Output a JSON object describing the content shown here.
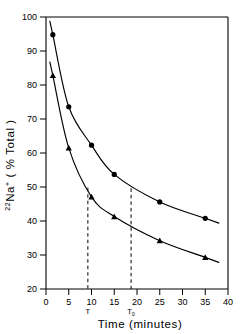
{
  "chart_data": {
    "type": "scatter",
    "title": "",
    "xlabel": "Time (minutes)",
    "ylabel": "22Na+ (% Total)",
    "ylabel_parts": {
      "superscript": "22",
      "element": "Na",
      "charge": "+",
      "units": "( % Total )"
    },
    "xlim": [
      0,
      40
    ],
    "ylim": [
      20,
      100
    ],
    "xticks": [
      0,
      5,
      10,
      15,
      20,
      25,
      30,
      35,
      40
    ],
    "xtick_labels": [
      "0",
      "5",
      "10",
      "15",
      "20",
      "25",
      "30",
      "35",
      "40"
    ],
    "yticks": [
      20,
      30,
      40,
      50,
      60,
      70,
      80,
      90,
      100
    ],
    "ytick_labels": [
      "20",
      "30",
      "40",
      "50",
      "60",
      "70",
      "80",
      "90",
      "100"
    ],
    "grid": false,
    "legend": "none",
    "series": [
      {
        "name": "upper-curve",
        "marker": "circle",
        "color": "#000000",
        "points": [
          {
            "x": 1.5,
            "y": 94.8
          },
          {
            "x": 5.0,
            "y": 73.6
          },
          {
            "x": 10.0,
            "y": 62.3
          },
          {
            "x": 15.0,
            "y": 53.7
          },
          {
            "x": 25.0,
            "y": 45.6
          },
          {
            "x": 35.0,
            "y": 40.8
          }
        ]
      },
      {
        "name": "lower-curve",
        "marker": "triangle",
        "color": "#000000",
        "points": [
          {
            "x": 1.5,
            "y": 82.8
          },
          {
            "x": 5.0,
            "y": 61.5
          },
          {
            "x": 10.0,
            "y": 47.1
          },
          {
            "x": 15.0,
            "y": 41.3
          },
          {
            "x": 25.0,
            "y": 34.2
          },
          {
            "x": 35.0,
            "y": 29.3
          }
        ]
      }
    ],
    "annotations": [
      {
        "name": "tau",
        "label": "T",
        "subscript": "",
        "x": 9.2,
        "y_top": 49.8,
        "style": "dashed-vertical"
      },
      {
        "name": "tau-zero",
        "label": "T",
        "subscript": "0",
        "x": 18.7,
        "y_top": 49.6,
        "style": "dashed-vertical"
      }
    ]
  }
}
